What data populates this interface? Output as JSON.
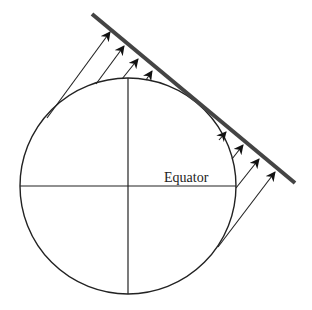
{
  "diagram": {
    "labels": {
      "equator": "Equator"
    },
    "colors": {
      "stroke": "#222222",
      "plane": "#444444",
      "background": "#ffffff"
    },
    "elements": [
      "sphere",
      "equator",
      "polar-axis",
      "tangent-plane",
      "parallel-rays"
    ]
  }
}
